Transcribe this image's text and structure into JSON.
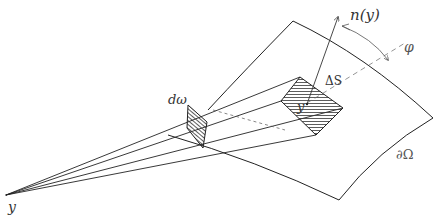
{
  "diagram": {
    "type": "geometry-sketch",
    "labels": {
      "normal": "n(y)",
      "angle": "φ",
      "surface_element": "ΔS",
      "solid_angle": "dω",
      "boundary": "∂Ω",
      "apex_point": "y",
      "surface_point": "y"
    },
    "colors": {
      "stroke": "#222222",
      "label": "#333333",
      "background": "#ffffff"
    }
  }
}
